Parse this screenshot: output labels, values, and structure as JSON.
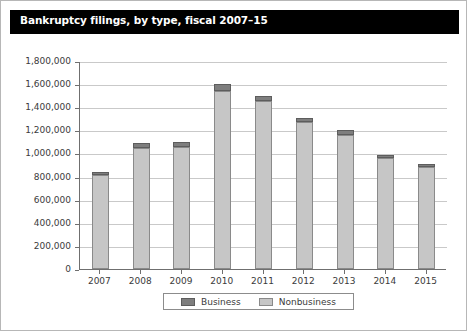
{
  "figure": {
    "title": "Bankruptcy filings, by type, fiscal 2007–15"
  },
  "chart_data": {
    "type": "bar",
    "stacked": true,
    "title": "Bankruptcy filings, by type, fiscal 2007–15",
    "xlabel": "",
    "ylabel": "",
    "categories": [
      "2007",
      "2008",
      "2009",
      "2010",
      "2011",
      "2012",
      "2013",
      "2014",
      "2015"
    ],
    "series": [
      {
        "name": "Nonbusiness",
        "color": "#c6c6c6",
        "values": [
          812000,
          1045000,
          1055000,
          1540000,
          1450000,
          1270000,
          1160000,
          965000,
          880000
        ]
      },
      {
        "name": "Business",
        "color": "#7e7e7e",
        "values": [
          28000,
          45000,
          45000,
          60000,
          50000,
          40000,
          40000,
          25000,
          30000
        ]
      }
    ],
    "totals": [
      840000,
      1090000,
      1100000,
      1600000,
      1500000,
      1310000,
      1200000,
      990000,
      910000
    ],
    "ylim": [
      0,
      1800000
    ],
    "ytick_values": [
      0,
      200000,
      400000,
      600000,
      800000,
      1000000,
      1200000,
      1400000,
      1600000,
      1800000
    ],
    "ytick_labels": [
      "0",
      "200,000",
      "400,000",
      "600,000",
      "800,000",
      "1,000,000",
      "1,200,000",
      "1,400,000",
      "1,600,000",
      "1,800,000"
    ],
    "grid": true,
    "legend_position": "bottom",
    "legend_entries": [
      "Business",
      "Nonbusiness"
    ]
  }
}
